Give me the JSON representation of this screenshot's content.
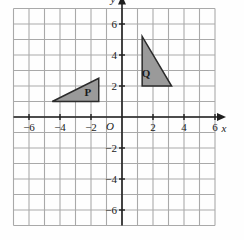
{
  "chart_data": {
    "type": "scatter",
    "title": "",
    "xlabel": "x",
    "ylabel": "y",
    "origin_label": "O",
    "grid": true,
    "xlim": [
      -7,
      6
    ],
    "ylim": [
      -7,
      7
    ],
    "x_ticks": [
      -6,
      -4,
      -2,
      2,
      4,
      6
    ],
    "y_ticks": [
      6,
      4,
      2,
      -2,
      -4,
      -6
    ],
    "x_tick_labels": [
      "-6",
      "-4",
      "-2",
      "2",
      "4",
      "6"
    ],
    "y_tick_labels": [
      "6",
      "4",
      "2",
      "-2",
      "-4",
      "-6"
    ],
    "shapes": [
      {
        "name": "P",
        "label": "P",
        "type": "triangle",
        "vertices": [
          [
            -4.5,
            1
          ],
          [
            -1.5,
            1
          ],
          [
            -1.5,
            2.5
          ]
        ],
        "label_position": [
          -2.2,
          1.55
        ],
        "fill": "#9a9a9a",
        "stroke": "#2b2b2b"
      },
      {
        "name": "Q",
        "label": "Q",
        "type": "triangle",
        "vertices": [
          [
            1.3,
            5.2
          ],
          [
            1.3,
            2.0
          ],
          [
            3.2,
            2.0
          ]
        ],
        "label_position": [
          1.55,
          2.75
        ],
        "fill": "#9a9a9a",
        "stroke": "#2b2b2b"
      }
    ],
    "colors": {
      "grid_line": "#a9a9a9",
      "axis_line": "#1f1f1f",
      "background": "#fefefe",
      "shape_fill": "#9a9a9a",
      "shape_stroke": "#2b2b2b"
    }
  }
}
